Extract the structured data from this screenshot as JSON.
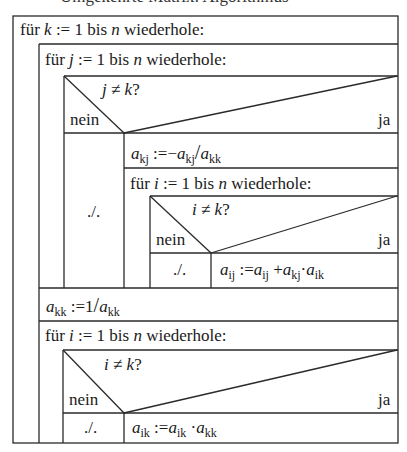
{
  "top_cut_text": "Umgekehrte Matrix: Algorithmus",
  "loop_k": {
    "keyword": "für",
    "var": "k",
    "assign": ":= 1 bis",
    "limit": "n",
    "tail": "wiederhole:"
  },
  "loop_j": {
    "keyword": "für",
    "var": "j",
    "assign": ":= 1 bis",
    "limit": "n",
    "tail": "wiederhole:"
  },
  "decision_j": {
    "condition_var": "j",
    "condition_op": "≠",
    "condition_rhs": "k",
    "q": "?",
    "no_label": "nein",
    "yes_label": "ja",
    "no_branch": "./."
  },
  "assign_akj": {
    "lhs_base": "a",
    "lhs_sub": "kj",
    "op": ":=",
    "rhs_neg": "−",
    "rhs1_base": "a",
    "rhs1_sub": "kj",
    "div": "/",
    "rhs2_base": "a",
    "rhs2_sub": "kk"
  },
  "loop_i1": {
    "keyword": "für",
    "var": "i",
    "assign": ":= 1 bis",
    "limit": "n",
    "tail": "wiederhole:"
  },
  "decision_i1": {
    "condition_var": "i",
    "condition_op": "≠",
    "condition_rhs": "k",
    "q": "?",
    "no_label": "nein",
    "yes_label": "ja",
    "no_branch": "./."
  },
  "assign_aij": {
    "lhs_base": "a",
    "lhs_sub": "ij",
    "op": ":=",
    "r1_base": "a",
    "r1_sub": "ij",
    "plus": "+",
    "r2_base": "a",
    "r2_sub": "kj",
    "dot": "·",
    "r3_base": "a",
    "r3_sub": "ik"
  },
  "assign_akk": {
    "lhs_base": "a",
    "lhs_sub": "kk",
    "op": ":=",
    "num": "1",
    "div": "/",
    "rhs_base": "a",
    "rhs_sub": "kk"
  },
  "loop_i2": {
    "keyword": "für",
    "var": "i",
    "assign": ":= 1 bis",
    "limit": "n",
    "tail": "wiederhole:"
  },
  "decision_i2": {
    "condition_var": "i",
    "condition_op": "≠",
    "condition_rhs": "k",
    "q": "?",
    "no_label": "nein",
    "yes_label": "ja",
    "no_branch": "./."
  },
  "assign_aik": {
    "lhs_base": "a",
    "lhs_sub": "ik",
    "op": ":=",
    "r1_base": "a",
    "r1_sub": "ik",
    "dot": "·",
    "r2_base": "a",
    "r2_sub": "kk"
  },
  "colors": {
    "line": "#2a2a2a",
    "background": "#ffffff",
    "text": "#1a1a1a"
  }
}
